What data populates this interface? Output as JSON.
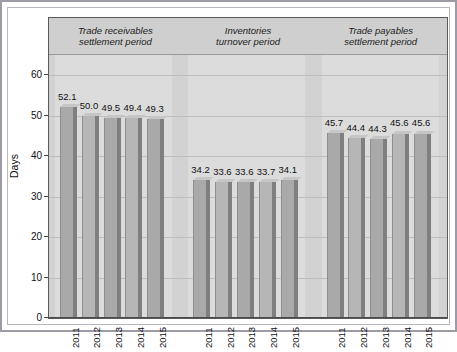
{
  "chart_data": {
    "type": "bar",
    "title": "",
    "subtitle": "",
    "xlabel": "",
    "ylabel": "Days",
    "ylim": [
      0,
      65
    ],
    "yticks": [
      0,
      10,
      20,
      30,
      40,
      50,
      60
    ],
    "grid": true,
    "legend": "none",
    "categories": [
      "2011",
      "2012",
      "2013",
      "2014",
      "2015"
    ],
    "groups": [
      {
        "name": "Trade receivables settlement period",
        "caption_line1": "Trade receivables",
        "caption_line2": "settlement period",
        "categories": [
          "2011",
          "2012",
          "2013",
          "2014",
          "2015"
        ],
        "values": [
          52.1,
          50.0,
          49.5,
          49.4,
          49.3
        ],
        "labels": [
          "52.1",
          "50.0",
          "49.5",
          "49.4",
          "49.3"
        ]
      },
      {
        "name": "Inventories turnover period",
        "caption_line1": "Inventories",
        "caption_line2": "turnover period",
        "categories": [
          "2011",
          "2012",
          "2013",
          "2014",
          "2015"
        ],
        "values": [
          34.2,
          33.6,
          33.6,
          33.7,
          34.1
        ],
        "labels": [
          "34.2",
          "33.6",
          "33.6",
          "33.7",
          "34.1"
        ]
      },
      {
        "name": "Trade payables settlement period",
        "caption_line1": "Trade payables",
        "caption_line2": "settlement period",
        "categories": [
          "2011",
          "2012",
          "2013",
          "2014",
          "2015"
        ],
        "values": [
          45.7,
          44.4,
          44.3,
          45.6,
          45.6
        ],
        "labels": [
          "45.7",
          "44.4",
          "44.3",
          "45.6",
          "45.6"
        ]
      }
    ],
    "colors": {
      "plot_background": "#d2d2d2",
      "band_background": "#dcdcdc",
      "bar_face": "#a9a9a9",
      "bar_face_alt": "#b6b6b6",
      "bar_side": "#7f7f7f",
      "bar_top": "#c6c6c6",
      "gridline": "#bdbdbd",
      "axis": "#4a4a4a",
      "text": "#111111",
      "frame": "#9e9aa6"
    }
  }
}
